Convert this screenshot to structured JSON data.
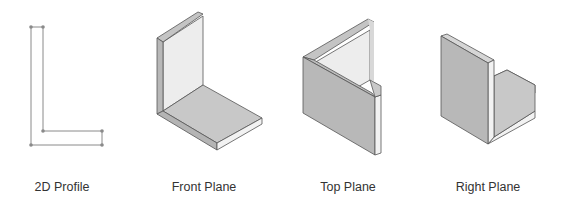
{
  "diagram": {
    "title": "",
    "panels": [
      {
        "id": "profile",
        "label": "2D Profile",
        "type": "2d-sketch"
      },
      {
        "id": "front",
        "label": "Front Plane",
        "type": "isometric-extrusion"
      },
      {
        "id": "top",
        "label": "Top Plane",
        "type": "isometric-extrusion"
      },
      {
        "id": "right",
        "label": "Right Plane",
        "type": "isometric-extrusion"
      }
    ],
    "colors": {
      "outline": "#555555",
      "sketch_line": "#8a8a8a",
      "sketch_point": "#8a8a8a",
      "face_light": "#ededed",
      "face_mid": "#c8c8c8",
      "face_dark": "#b4b4b4",
      "edge_highlight": "#f4f4f4",
      "caption": "#333333"
    }
  }
}
